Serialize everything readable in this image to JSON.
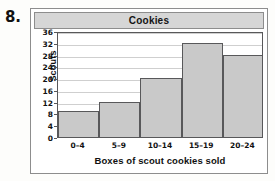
{
  "question": {
    "number": "8."
  },
  "chart_data": {
    "type": "bar",
    "title": "Cookies",
    "xlabel": "Boxes of scout cookies sold",
    "ylabel": "Scouts",
    "categories": [
      "0–4",
      "5–9",
      "10–14",
      "15–19",
      "20–24"
    ],
    "values": [
      9,
      12,
      20,
      32,
      28
    ],
    "ylim": [
      0,
      36
    ],
    "yticks": [
      0,
      4,
      8,
      12,
      16,
      20,
      24,
      28,
      32,
      36
    ],
    "ytick_labels": [
      "0",
      "4",
      "8",
      "12",
      "16",
      "20",
      "24",
      "28",
      "32",
      "36"
    ],
    "grid": true,
    "legend": false,
    "colors": {
      "bar_fill": "#c9c9c9",
      "bar_edge": "#58585a",
      "grid": "#cfcfcf",
      "title_band": "#d6d6d6",
      "panel_border": "#8d8d8d"
    }
  }
}
